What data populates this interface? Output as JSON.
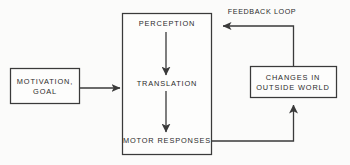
{
  "diagram": {
    "background_color": "#fbfbfa",
    "line_color": "#3a3a3a",
    "text_color": "#2b2b2b",
    "boxes": {
      "motivation": {
        "line1": "MOTIVATION,",
        "line2": "GOAL"
      },
      "process": {
        "stage1": "PERCEPTION",
        "stage2": "TRANSLATION",
        "stage3": "MOTOR RESPONSES"
      },
      "outside_world": {
        "line1": "CHANGES IN",
        "line2": "OUTSIDE WORLD"
      }
    },
    "labels": {
      "feedback_loop": "FEEDBACK LOOP"
    }
  }
}
